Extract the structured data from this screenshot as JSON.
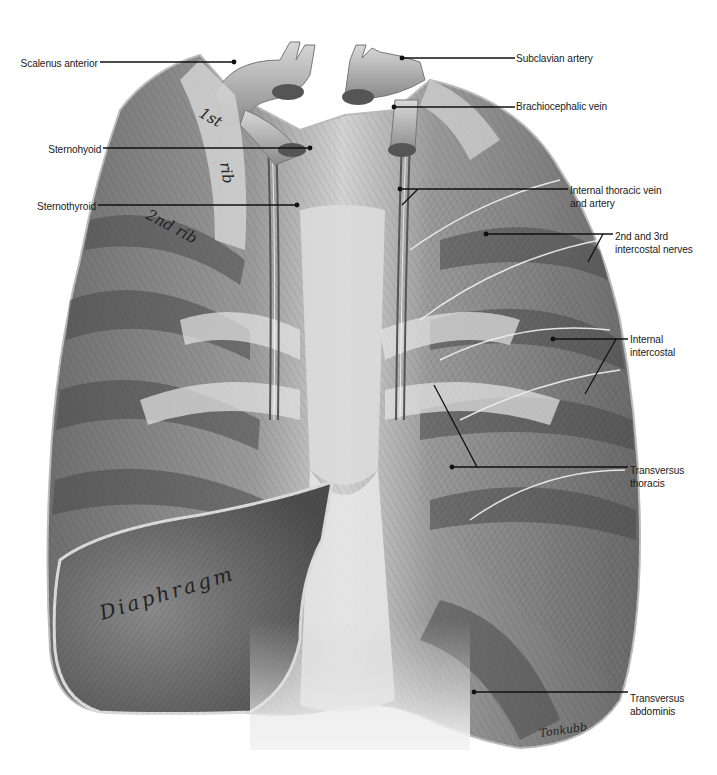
{
  "figure": {
    "type": "anatomical-illustration",
    "colors": {
      "background": "#ffffff",
      "ink": "#1a1a1a",
      "muscle_dark": "#4a4a4a",
      "muscle_mid": "#8c8c8c",
      "muscle_light": "#c9c9c9",
      "tendon": "#e4e4e4"
    }
  },
  "in_image_text": {
    "rib1_a": "1st",
    "rib1_b": "rib",
    "rib2": "2nd rib",
    "diaphragm": "Diaphragm",
    "signature": "Tonkubb"
  },
  "labels": [
    {
      "id": "scalenus-anterior",
      "text": "Scalenus anterior",
      "side": "left",
      "x": 22,
      "y": 57,
      "line": [
        [
          100,
          62
        ],
        [
          234,
          62
        ]
      ]
    },
    {
      "id": "sternohyoid",
      "text": "Sternohyoid",
      "side": "left",
      "x": 48,
      "y": 143,
      "line": [
        [
          103,
          148
        ],
        [
          310,
          148
        ]
      ]
    },
    {
      "id": "sternothyroid",
      "text": "Sternothyroid",
      "side": "left",
      "x": 33,
      "y": 200,
      "line": [
        [
          98,
          205
        ],
        [
          297,
          205
        ]
      ]
    },
    {
      "id": "subclavian-artery",
      "text": "Subclavian artery",
      "side": "right",
      "x": 516,
      "y": 52,
      "line": [
        [
          402,
          58
        ],
        [
          515,
          58
        ]
      ]
    },
    {
      "id": "brachiocephalic-vein",
      "text": "Brachiocephalic vein",
      "side": "right",
      "x": 516,
      "y": 100,
      "line": [
        [
          394,
          107
        ],
        [
          515,
          107
        ]
      ]
    },
    {
      "id": "internal-thoracic-vein-artery",
      "text": "Internal thoracic vein\nand artery",
      "side": "right",
      "x": 570,
      "y": 184,
      "line": [
        [
          400,
          189
        ],
        [
          568,
          189
        ]
      ],
      "extra": [
        [
          [
            418,
            189
          ],
          [
            402,
            205
          ]
        ]
      ]
    },
    {
      "id": "intercostal-nerves",
      "text": "2nd and 3rd\nintercostal nerves",
      "side": "right",
      "x": 615,
      "y": 230,
      "line": [
        [
          486,
          234
        ],
        [
          613,
          234
        ]
      ],
      "extra": [
        [
          [
            603,
            234
          ],
          [
            588,
            262
          ]
        ]
      ]
    },
    {
      "id": "internal-intercostal",
      "text": "Internal\nintercostal",
      "side": "right",
      "x": 630,
      "y": 333,
      "line": [
        [
          553,
          339
        ],
        [
          628,
          339
        ]
      ],
      "extra": [
        [
          [
            616,
            339
          ],
          [
            585,
            394
          ]
        ]
      ]
    },
    {
      "id": "transversus-thoracis",
      "text": "Transversus\nthoracis",
      "side": "right",
      "x": 630,
      "y": 464,
      "line": [
        [
          452,
          467
        ],
        [
          628,
          467
        ]
      ],
      "extra": [
        [
          [
            477,
            467
          ],
          [
            434,
            385
          ]
        ]
      ]
    },
    {
      "id": "transversus-abdominis",
      "text": "Transversus\nabdominis",
      "side": "right",
      "x": 630,
      "y": 692,
      "line": [
        [
          474,
          692
        ],
        [
          628,
          692
        ]
      ]
    }
  ]
}
